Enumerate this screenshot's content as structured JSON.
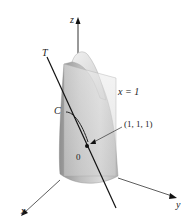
{
  "figure": {
    "axes": {
      "x_label": "x",
      "y_label": "y",
      "z_label": "z"
    },
    "labels": {
      "tangent": "T",
      "curve": "C",
      "plane": "x = 1",
      "point": "(1, 1, 1)",
      "origin": "0"
    },
    "colors": {
      "surface_light": "#e4e4e4",
      "surface_mid": "#c9c9c9",
      "surface_dark": "#9a9a9a",
      "plane": "#d6d6d6",
      "line": "#111111",
      "axis": "#333333"
    }
  }
}
